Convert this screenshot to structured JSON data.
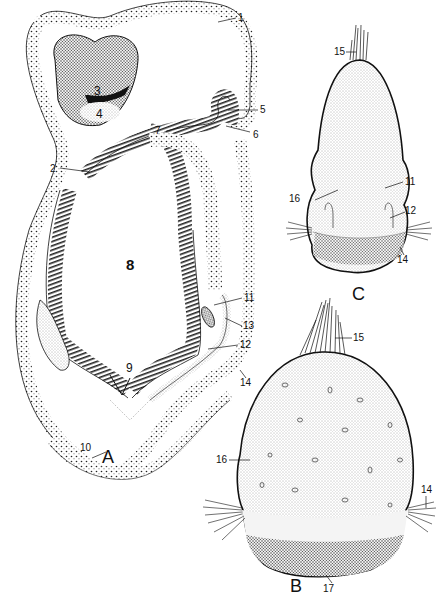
{
  "figure": {
    "panels": [
      {
        "id": "A",
        "label": "A",
        "description": "Longitudinal section of larva"
      },
      {
        "id": "B",
        "label": "B",
        "description": "Larva external view (rounded)"
      },
      {
        "id": "C",
        "label": "C",
        "description": "Larva external view (elongated)"
      }
    ],
    "panel_A_labels": [
      "1",
      "2",
      "3",
      "4",
      "5",
      "6",
      "7",
      "8",
      "9",
      "10",
      "11",
      "12",
      "13",
      "14"
    ],
    "panel_B_labels": [
      "14",
      "15",
      "16",
      "17"
    ],
    "panel_C_labels": [
      "11",
      "12",
      "14",
      "15",
      "16"
    ],
    "labels": {
      "a1": "1",
      "a2": "2",
      "a3": "3",
      "a4": "4",
      "a5": "5",
      "a6": "6",
      "a7": "7",
      "a8": "8",
      "a9": "9",
      "a10": "10",
      "a11": "11",
      "a12": "12",
      "a13": "13",
      "a14": "14",
      "c15": "15",
      "c16": "16",
      "c11": "11",
      "c12": "12",
      "c14": "14",
      "b15": "15",
      "b16": "16",
      "b14": "14",
      "b17": "17",
      "panelA": "A",
      "panelB": "B",
      "panelC": "C"
    }
  }
}
